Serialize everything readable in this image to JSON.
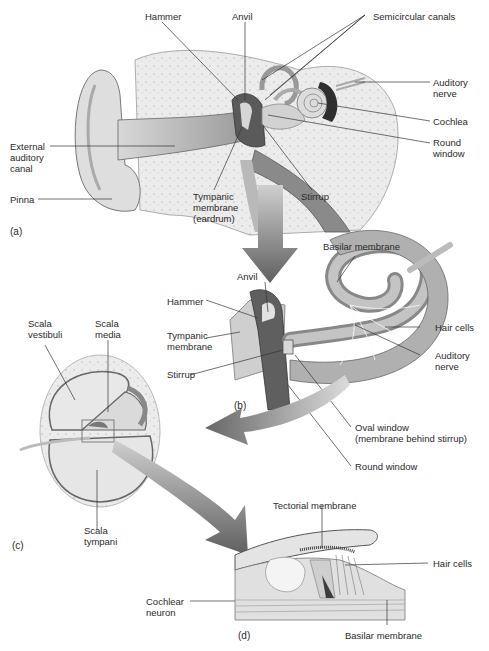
{
  "panel_a": {
    "tag": "(a)",
    "labels": {
      "hammer": "Hammer",
      "anvil": "Anvil",
      "semicircular_canals": "Semicircular canals",
      "auditory_nerve": "Auditory\nnerve",
      "cochlea": "Cochlea",
      "round_window": "Round\nwindow",
      "external_auditory_canal": "External\nauditory\ncanal",
      "pinna": "Pinna",
      "tympanic_membrane": "Tympanic\nmembrane\n(eardrum)",
      "stirrup": "Stirrup"
    }
  },
  "panel_b": {
    "tag": "(b)",
    "labels": {
      "basilar_membrane": "Basilar membrane",
      "anvil": "Anvil",
      "hammer": "Hammer",
      "tympanic_membrane": "Tympanic\nmembrane",
      "stirrup": "Stirrup",
      "hair_cells": "Hair cells",
      "auditory_nerve": "Auditory\nnerve",
      "oval_window": "Oval window\n(membrane behind stirrup)",
      "round_window": "Round window"
    }
  },
  "panel_c": {
    "tag": "(c)",
    "labels": {
      "scala_vestibuli": "Scala\nvestibuli",
      "scala_media": "Scala\nmedia",
      "scala_tympani": "Scala\ntympani"
    }
  },
  "panel_d": {
    "tag": "(d)",
    "labels": {
      "tectorial_membrane": "Tectorial membrane",
      "hair_cells": "Hair cells",
      "cochlear_neuron": "Cochlear\nneuron",
      "basilar_membrane": "Basilar membrane"
    }
  },
  "colors": {
    "bone": "#e6e6e6",
    "tissue": "#c8c8c8",
    "dark": "#555555",
    "arrow": "#6e6e6e",
    "line": "#333333"
  }
}
